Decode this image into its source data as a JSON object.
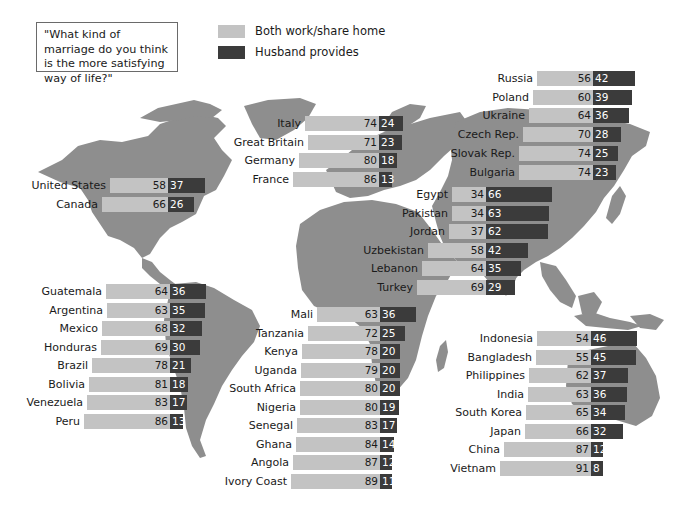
{
  "chart_data": {
    "type": "bar",
    "subtype": "diverging stacked horizontal bars over world map",
    "title": "\"What kind of marriage do you think is the more satisfying way of life?\"",
    "legend": [
      {
        "name": "Both work/share home",
        "color": "#c3c3c3"
      },
      {
        "name": "Husband provides",
        "color": "#3b3b3b"
      }
    ],
    "legend_position": "top",
    "unit": "percent",
    "groups": [
      {
        "name": "North America",
        "rows": [
          {
            "country": "United States",
            "both": 58,
            "husband": 37
          },
          {
            "country": "Canada",
            "both": 66,
            "husband": 26
          }
        ]
      },
      {
        "name": "Western Europe",
        "rows": [
          {
            "country": "Italy",
            "both": 74,
            "husband": 24
          },
          {
            "country": "Great Britain",
            "both": 71,
            "husband": 23
          },
          {
            "country": "Germany",
            "both": 80,
            "husband": 18
          },
          {
            "country": "France",
            "both": 86,
            "husband": 13
          }
        ]
      },
      {
        "name": "Eastern Europe",
        "rows": [
          {
            "country": "Russia",
            "both": 56,
            "husband": 42
          },
          {
            "country": "Poland",
            "both": 60,
            "husband": 39
          },
          {
            "country": "Ukraine",
            "both": 64,
            "husband": 36
          },
          {
            "country": "Czech Rep.",
            "both": 70,
            "husband": 28
          },
          {
            "country": "Slovak Rep.",
            "both": 74,
            "husband": 25
          },
          {
            "country": "Bulgaria",
            "both": 74,
            "husband": 23
          }
        ]
      },
      {
        "name": "Middle East / Central Asia",
        "rows": [
          {
            "country": "Egypt",
            "both": 34,
            "husband": 66
          },
          {
            "country": "Pakistan",
            "both": 34,
            "husband": 63
          },
          {
            "country": "Jordan",
            "both": 37,
            "husband": 62
          },
          {
            "country": "Uzbekistan",
            "both": 58,
            "husband": 42
          },
          {
            "country": "Lebanon",
            "both": 64,
            "husband": 35
          },
          {
            "country": "Turkey",
            "both": 69,
            "husband": 29
          }
        ]
      },
      {
        "name": "Latin America",
        "rows": [
          {
            "country": "Guatemala",
            "both": 64,
            "husband": 36
          },
          {
            "country": "Argentina",
            "both": 63,
            "husband": 35
          },
          {
            "country": "Mexico",
            "both": 68,
            "husband": 32
          },
          {
            "country": "Honduras",
            "both": 69,
            "husband": 30
          },
          {
            "country": "Brazil",
            "both": 78,
            "husband": 21
          },
          {
            "country": "Bolivia",
            "both": 81,
            "husband": 18
          },
          {
            "country": "Venezuela",
            "both": 83,
            "husband": 17
          },
          {
            "country": "Peru",
            "both": 86,
            "husband": 13
          }
        ]
      },
      {
        "name": "Africa",
        "rows": [
          {
            "country": "Mali",
            "both": 63,
            "husband": 36
          },
          {
            "country": "Tanzania",
            "both": 72,
            "husband": 25
          },
          {
            "country": "Kenya",
            "both": 78,
            "husband": 20
          },
          {
            "country": "Uganda",
            "both": 79,
            "husband": 20
          },
          {
            "country": "South Africa",
            "both": 80,
            "husband": 20
          },
          {
            "country": "Nigeria",
            "both": 80,
            "husband": 19
          },
          {
            "country": "Senegal",
            "both": 83,
            "husband": 17
          },
          {
            "country": "Ghana",
            "both": 84,
            "husband": 14
          },
          {
            "country": "Angola",
            "both": 87,
            "husband": 12
          },
          {
            "country": "Ivory Coast",
            "both": 89,
            "husband": 11
          }
        ]
      },
      {
        "name": "Asia",
        "rows": [
          {
            "country": "Indonesia",
            "both": 54,
            "husband": 46
          },
          {
            "country": "Bangladesh",
            "both": 55,
            "husband": 45
          },
          {
            "country": "Philippines",
            "both": 62,
            "husband": 37
          },
          {
            "country": "India",
            "both": 63,
            "husband": 36
          },
          {
            "country": "South Korea",
            "both": 65,
            "husband": 34
          },
          {
            "country": "Japan",
            "both": 66,
            "husband": 32
          },
          {
            "country": "China",
            "both": 87,
            "husband": 12
          },
          {
            "country": "Vietnam",
            "both": 91,
            "husband": 8
          }
        ]
      }
    ]
  },
  "question": {
    "text": "\"What kind of marriage do you think is the more satisfying way of life?\""
  },
  "legend": {
    "items": [
      {
        "label": "Both work/share home",
        "color": "#c3c3c3"
      },
      {
        "label": "Husband provides",
        "color": "#3b3b3b"
      }
    ]
  },
  "colors": {
    "map_land": "#8e8e8e",
    "background": "#ffffff",
    "bar_light": "#c3c3c3",
    "bar_dark": "#3b3b3b"
  }
}
